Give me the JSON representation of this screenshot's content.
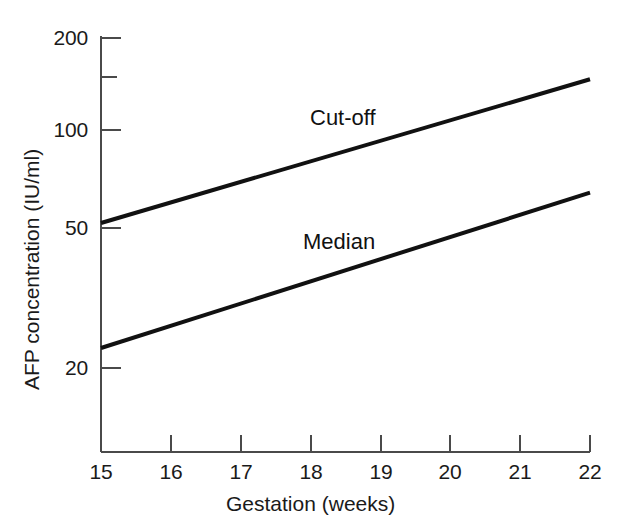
{
  "chart_data": {
    "type": "line",
    "title": "",
    "subtitle": "",
    "xlabel": "Gestation (weeks)",
    "ylabel": "AFP concentration (IU/ml)",
    "xlim": [
      15,
      22
    ],
    "ylim": [
      15,
      200
    ],
    "yscale": "log",
    "xscale": "linear",
    "grid": false,
    "legend_position": "inline-annotation",
    "xticks": [
      15,
      16,
      17,
      18,
      19,
      20,
      21,
      22
    ],
    "xtick_labels": [
      "15",
      "16",
      "17",
      "18",
      "19",
      "20",
      "21",
      "22"
    ],
    "yticks": [
      20,
      50,
      100,
      150,
      200
    ],
    "ytick_labels": [
      "20",
      "50",
      "100",
      "",
      "200"
    ],
    "series": [
      {
        "name": "Cut-off",
        "x": [
          15,
          22
        ],
        "values": [
          55,
          150
        ],
        "annotation": "Cut-off"
      },
      {
        "name": "Median",
        "x": [
          15,
          22
        ],
        "values": [
          23,
          68
        ],
        "annotation": "Median"
      }
    ]
  },
  "axes": {
    "x_title": "Gestation (weeks)",
    "y_title": "AFP concentration (IU/ml)"
  },
  "annotations": {
    "cutoff_label": "Cut-off",
    "median_label": "Median"
  },
  "colors": {
    "line": "#111111",
    "axis": "#4a4a4a",
    "text": "#1a1a1a",
    "background": "#ffffff"
  }
}
